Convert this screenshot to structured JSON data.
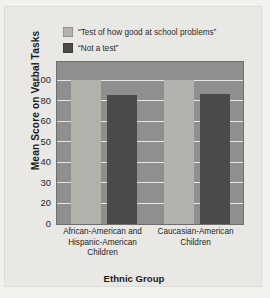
{
  "chart_data": {
    "type": "bar",
    "title": "",
    "xlabel": "Ethnic Group",
    "ylabel": "Mean Score on Verbal Tasks",
    "categories": [
      "African-American and Hispanic-American Children",
      "Caucasian-American Children"
    ],
    "category_lines": [
      [
        "African-American and",
        "Hispanic-American",
        "Children"
      ],
      [
        "Caucasian-American",
        "Children"
      ]
    ],
    "series": [
      {
        "name": "“Test of how good at school problems”",
        "color": "#b3b2ad",
        "values": [
          100,
          100
        ]
      },
      {
        "name": "“Not a test”",
        "color": "#4a4a4a",
        "values": [
          85,
          86
        ]
      }
    ],
    "ylim": [
      0,
      110
    ],
    "yticks": [
      0,
      20,
      30,
      40,
      50,
      60,
      80,
      100
    ],
    "ytick_labels": [
      "0",
      "20",
      "30",
      "40",
      "50",
      "60",
      "80",
      "100"
    ],
    "grid": true,
    "legend_position": "top-left"
  },
  "legend": {
    "items": [
      {
        "label": "“Test of how good at school problems”",
        "color": "#b3b2ad"
      },
      {
        "label": "“Not a test”",
        "color": "#4a4a4a"
      }
    ]
  },
  "axes": {
    "y_title": "Mean Score on Verbal Tasks",
    "x_title": "Ethnic Group"
  }
}
